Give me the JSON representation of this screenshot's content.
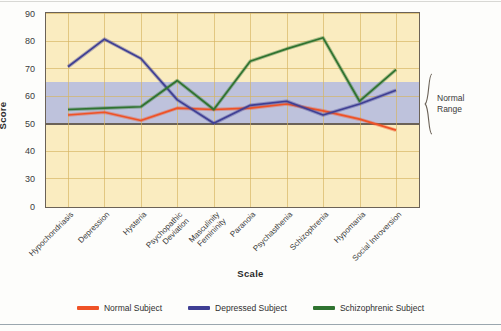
{
  "chart_data": {
    "type": "line",
    "title": "",
    "xlabel": "Scale",
    "ylabel": "Score",
    "ylim": [
      0,
      90
    ],
    "yticks": [
      0,
      30,
      40,
      50,
      60,
      70,
      80,
      90
    ],
    "grid": true,
    "legend_position": "bottom",
    "categories": [
      "Hypochondriasis",
      "Depression",
      "Hysteria",
      "Psychopathic\nDeviation",
      "Masculinity\nFemininity",
      "Paranoia",
      "Psychasthenia",
      "Schizophrenia",
      "Hypomania",
      "Social Introversion"
    ],
    "series": [
      {
        "name": "Normal Subject",
        "color": "#ef5226",
        "values": [
          53,
          54,
          51,
          55.5,
          55,
          55.5,
          57,
          54.5,
          51.5,
          47.5
        ]
      },
      {
        "name": "Depressed Subject",
        "color": "#3f3f94",
        "values": [
          70.5,
          80.5,
          73.5,
          58.5,
          50,
          56.5,
          58,
          53,
          57,
          62
        ]
      },
      {
        "name": "Schizophrenic Subject",
        "color": "#2f7330",
        "values": [
          55,
          55.5,
          56,
          65.5,
          55,
          72.5,
          77,
          81,
          58,
          69.5
        ]
      }
    ],
    "annotations": [
      {
        "label": "Normal\nRange",
        "band_low": 50,
        "band_high": 65
      }
    ]
  },
  "axes": {
    "y_title": "Score",
    "x_title": "Scale",
    "y_tick_labels": [
      "90",
      "80",
      "70",
      "60",
      "50",
      "40",
      "30",
      "0"
    ]
  },
  "annotation": {
    "normal_range_line1": "Normal",
    "normal_range_line2": "Range"
  },
  "legend": {
    "items": [
      {
        "label": "Normal Subject",
        "color": "#ef5226"
      },
      {
        "label": "Depressed Subject",
        "color": "#3f3f94"
      },
      {
        "label": "Schizophrenic Subject",
        "color": "#2f7330"
      }
    ]
  },
  "colors": {
    "plot_background": "#faecc0",
    "normal_band": "#b9bede",
    "grid": "#d6b45f",
    "frame": "#6b6257"
  }
}
